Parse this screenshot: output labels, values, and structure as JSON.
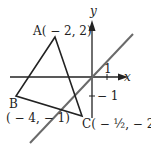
{
  "diagram": {
    "type": "coordinate-plane",
    "axes": {
      "x_label": "x",
      "y_label": "y",
      "x_tick_label": "1",
      "y_tick_label": "− 1"
    },
    "triangle": {
      "vertices": [
        {
          "name": "A",
          "label": "A( − 2, 2)",
          "x": -2,
          "y": 2
        },
        {
          "name": "B",
          "label": "B",
          "coord_label": "( − 4, − 1)",
          "x": -4,
          "y": -1
        },
        {
          "name": "C",
          "label": "C( − ½, − 2)",
          "x": -0.5,
          "y": -2
        }
      ]
    },
    "line": {
      "description": "line through origin with positive slope",
      "color": "#6a6a6a"
    },
    "colors": {
      "triangle": "#222222",
      "axes": "#222222",
      "line": "#6a6a6a"
    }
  }
}
